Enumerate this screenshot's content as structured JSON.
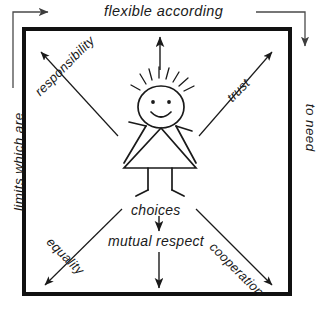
{
  "diagram": {
    "title_phrase": "limits which are flexible according to need",
    "frame": {
      "color": "#111111",
      "border_width_px": 4,
      "left": 22,
      "top": 27,
      "right": 292,
      "bottom": 296
    },
    "outer_labels": [
      {
        "id": "top",
        "text": "flexible according",
        "orientation": "horizontal"
      },
      {
        "id": "left",
        "text": "limits which are",
        "orientation": "rotated-ccw"
      },
      {
        "id": "right",
        "text": "to need",
        "orientation": "rotated-cw"
      }
    ],
    "diagonal_labels": [
      {
        "id": "responsibility",
        "text": "responsibility",
        "direction": "up-left"
      },
      {
        "id": "trust",
        "text": "trust",
        "direction": "up-right"
      },
      {
        "id": "equality",
        "text": "equality",
        "direction": "down-left"
      },
      {
        "id": "cooperation",
        "text": "cooperation",
        "direction": "down-right"
      }
    ],
    "center_labels": [
      {
        "id": "choices",
        "text": "choices"
      },
      {
        "id": "mutual-respect",
        "text": "mutual  respect"
      }
    ],
    "figure": {
      "name": "stick-figure-child",
      "features": [
        "spiky-hair",
        "two-dot-eyes",
        "smile",
        "outstretched-arms",
        "triangular-dress",
        "two-legs"
      ]
    },
    "colors": {
      "ink": "#1a1a1a",
      "frame": "#111111",
      "background": "#ffffff",
      "outer_arrow": "#5a5a5a"
    }
  }
}
